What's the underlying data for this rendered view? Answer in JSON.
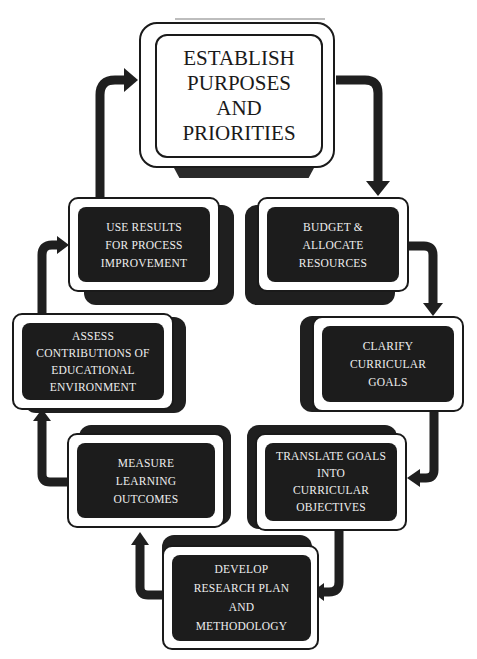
{
  "diagram": {
    "type": "cycle-flowchart",
    "colors": {
      "background": "#ffffff",
      "box_fill": "#1c1c1c",
      "box_text": "#eeeeee",
      "arrow": "#1f1f1f",
      "main_text": "#1a1a1a"
    },
    "main_step": {
      "lines": [
        "ESTABLISH",
        "PURPOSES",
        "AND",
        "PRIORITIES"
      ]
    },
    "steps": [
      {
        "id": "budget",
        "lines": [
          "BUDGET &",
          "ALLOCATE",
          "RESOURCES"
        ]
      },
      {
        "id": "clarify",
        "lines": [
          "CLARIFY",
          "CURRICULAR",
          "GOALS"
        ]
      },
      {
        "id": "translate",
        "lines": [
          "TRANSLATE GOALS",
          "INTO",
          "CURRICULAR",
          "OBJECTIVES"
        ]
      },
      {
        "id": "develop",
        "lines": [
          "DEVELOP",
          "RESEARCH PLAN",
          "AND",
          "METHODOLOGY"
        ]
      },
      {
        "id": "measure",
        "lines": [
          "MEASURE",
          "LEARNING",
          "OUTCOMES"
        ]
      },
      {
        "id": "assess",
        "lines": [
          "ASSESS",
          "CONTRIBUTIONS OF",
          "EDUCATIONAL",
          "ENVIRONMENT"
        ]
      },
      {
        "id": "use_results",
        "lines": [
          "USE RESULTS",
          "FOR PROCESS",
          "IMPROVEMENT"
        ]
      }
    ],
    "flow": [
      "ESTABLISH PURPOSES AND PRIORITIES",
      "BUDGET & ALLOCATE RESOURCES",
      "CLARIFY CURRICULAR GOALS",
      "TRANSLATE GOALS INTO CURRICULAR OBJECTIVES",
      "DEVELOP RESEARCH PLAN AND METHODOLOGY",
      "MEASURE LEARNING OUTCOMES",
      "ASSESS CONTRIBUTIONS OF EDUCATIONAL ENVIRONMENT",
      "USE RESULTS FOR PROCESS IMPROVEMENT",
      "ESTABLISH PURPOSES AND PRIORITIES"
    ]
  }
}
